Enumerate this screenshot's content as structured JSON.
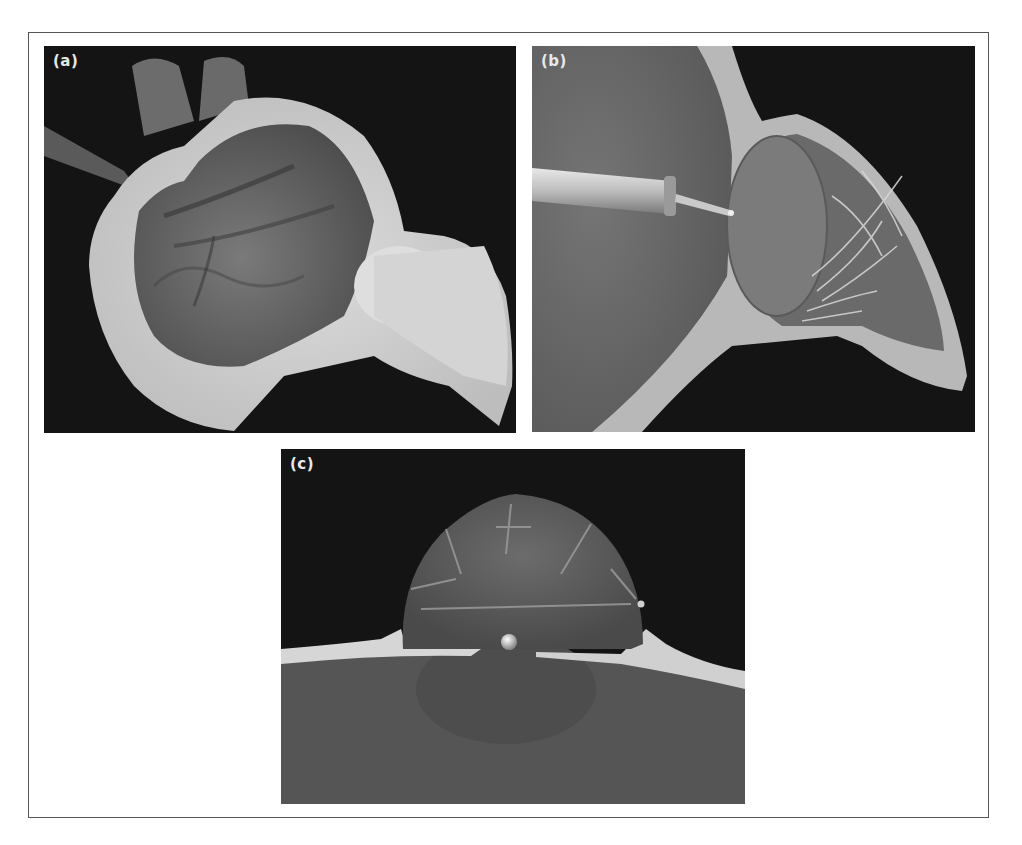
{
  "figure": {
    "panels": [
      {
        "id": "a",
        "label": "(a)",
        "description": "Cut-away 3D rendering of heart chamber with atrium and outflow"
      },
      {
        "id": "b",
        "label": "(b)",
        "description": "Catheter instrument approaching valve with chordae tendineae inside ventricle"
      },
      {
        "id": "c",
        "label": "(c)",
        "description": "Close-up of dome-shaped valve with struts and metallic tip at center"
      }
    ],
    "colors": {
      "background": "#141414",
      "tissue_wall": "#c8c8c8",
      "chamber": "#6e6e6e",
      "frame": "#555555"
    }
  }
}
